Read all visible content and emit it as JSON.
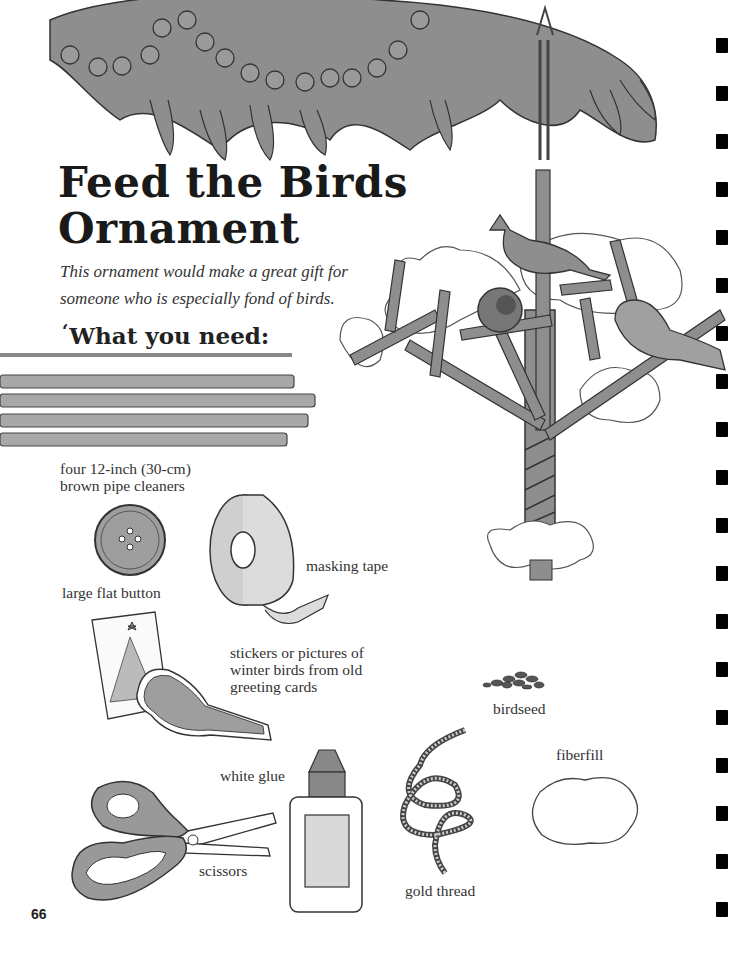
{
  "page": {
    "title_line1": "Feed the Birds",
    "title_line2": "Ornament",
    "intro_line1": "This ornament would make a great gift for",
    "intro_line2": "someone who is especially fond of birds.",
    "section_heading": "What you need:",
    "section_curl": "‘",
    "page_number": "66"
  },
  "materials": [
    {
      "id": "pipe-cleaners",
      "label_line1": "four 12-inch (30-cm)",
      "label_line2": "brown pipe cleaners"
    },
    {
      "id": "button",
      "label": "large flat button"
    },
    {
      "id": "masking-tape",
      "label": "masking tape"
    },
    {
      "id": "stickers",
      "label_line1": "stickers or pictures of",
      "label_line2": "winter birds  from old",
      "label_line3": "greeting cards"
    },
    {
      "id": "birdseed",
      "label": "birdseed"
    },
    {
      "id": "fiberfill",
      "label": "fiberfill"
    },
    {
      "id": "white-glue",
      "label": "white glue"
    },
    {
      "id": "scissors",
      "label": "scissors"
    },
    {
      "id": "gold-thread",
      "label": "gold thread"
    }
  ],
  "colors": {
    "illustration_fill": "#8a8a8a",
    "illustration_light": "#c4c4c4",
    "ink": "#333333",
    "rule": "#888888",
    "binding_holes": "#000000"
  }
}
